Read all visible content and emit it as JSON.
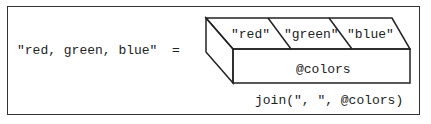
{
  "diagram": {
    "result_string": "\"red, green, blue\"",
    "equals": "=",
    "array": {
      "name": "@colors",
      "elements": [
        "\"red\"",
        "\"green\"",
        "\"blue\""
      ]
    },
    "expression": "join(\", \", @colors)"
  },
  "colors": {
    "stroke": "#222222",
    "background": "#ffffff",
    "text": "#222222"
  }
}
